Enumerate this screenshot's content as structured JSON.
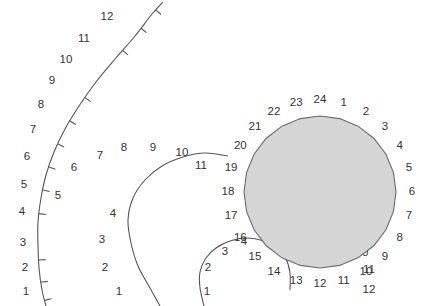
{
  "figure": {
    "title": "",
    "background_color": "#ffffff",
    "curve_color": "#555555",
    "label_color": "#333333",
    "polygon_fill_color": "#d5d5d5",
    "polygon_stroke_color": "#6a6a6a"
  },
  "chart_data": {
    "type": "scatter",
    "title": "",
    "xlabel": "",
    "ylabel": "",
    "grid": false,
    "legend": "none",
    "xlim": [
      0,
      429
    ],
    "ylim": [
      0,
      306
    ],
    "series": [
      {
        "name": "outer-arc",
        "type": "arc-with-ticks",
        "labels": [
          "1",
          "2",
          "3",
          "4",
          "5",
          "6",
          "7",
          "8",
          "9",
          "10",
          "11",
          "12"
        ],
        "label_points": [
          [
            26,
            292
          ],
          [
            25,
            268
          ],
          [
            23,
            243
          ],
          [
            22,
            212
          ],
          [
            24,
            185
          ],
          [
            27,
            157
          ],
          [
            33,
            130
          ],
          [
            41,
            105
          ],
          [
            52,
            81
          ],
          [
            66,
            60
          ],
          [
            84,
            39
          ],
          [
            107,
            17
          ]
        ],
        "path_points": [
          [
            46,
            306
          ],
          [
            42,
            290
          ],
          [
            39,
            268
          ],
          [
            38,
            245
          ],
          [
            38,
            222
          ],
          [
            41,
            198
          ],
          [
            46,
            175
          ],
          [
            54,
            152
          ],
          [
            65,
            129
          ],
          [
            79,
            106
          ],
          [
            96,
            82
          ],
          [
            116,
            58
          ],
          [
            135,
            36
          ],
          [
            152,
            14
          ],
          [
            163,
            2
          ]
        ],
        "has_ticks": true,
        "tick_count": 12
      },
      {
        "name": "middle-arc",
        "type": "arc",
        "labels": [
          "1",
          "2",
          "3",
          "4",
          "5",
          "6",
          "7",
          "8",
          "9",
          "10",
          "11",
          "12"
        ],
        "label_points": [
          [
            119,
            292
          ],
          [
            105,
            268
          ],
          [
            102,
            240
          ],
          [
            113,
            214
          ],
          [
            144,
            196
          ],
          [
            186,
            178
          ],
          [
            74,
            168
          ],
          [
            100,
            156
          ],
          [
            124,
            148
          ],
          [
            153,
            148
          ],
          [
            182,
            153
          ],
          [
            201,
            166
          ]
        ],
        "label_points_actual": [
          [
            119,
            292
          ],
          [
            105,
            268
          ],
          [
            102,
            240
          ],
          [
            113,
            214
          ],
          [
            58,
            196
          ],
          [
            74,
            168
          ],
          [
            100,
            156
          ],
          [
            124,
            148
          ],
          [
            153,
            148
          ],
          [
            182,
            153
          ],
          [
            201,
            166
          ]
        ],
        "path_points": [
          [
            160,
            306
          ],
          [
            150,
            288
          ],
          [
            138,
            266
          ],
          [
            131,
            243
          ],
          [
            128,
            220
          ],
          [
            133,
            198
          ],
          [
            145,
            180
          ],
          [
            162,
            166
          ],
          [
            183,
            157
          ],
          [
            205,
            153
          ],
          [
            228,
            156
          ]
        ]
      },
      {
        "name": "inner-arc",
        "type": "arc",
        "labels": [
          "1",
          "2",
          "3",
          "4",
          "5",
          "6",
          "7",
          "8",
          "9",
          "10",
          "11",
          "12"
        ],
        "label_points": [
          [
            207,
            292
          ],
          [
            208,
            268
          ],
          [
            225,
            252
          ],
          [
            244,
            242
          ],
          [
            265,
            236
          ],
          [
            287,
            234
          ],
          [
            308,
            234
          ],
          [
            327,
            236
          ],
          [
            347,
            242
          ],
          [
            362,
            253
          ],
          [
            369,
            270
          ],
          [
            369,
            290
          ]
        ],
        "path_points": [
          [
            204,
            306
          ],
          [
            200,
            288
          ],
          [
            200,
            272
          ],
          [
            206,
            258
          ],
          [
            216,
            248
          ],
          [
            230,
            241
          ],
          [
            247,
            238
          ],
          [
            264,
            241
          ],
          [
            277,
            248
          ],
          [
            286,
            259
          ],
          [
            290,
            273
          ],
          [
            290,
            290
          ]
        ]
      },
      {
        "name": "filled-polygon-24",
        "type": "polygon",
        "center": [
          320,
          192
        ],
        "radius": 76,
        "sides": 24,
        "start_angle_deg": -75,
        "labels": [
          "1",
          "2",
          "3",
          "4",
          "5",
          "6",
          "7",
          "8",
          "9",
          "10",
          "11",
          "12",
          "13",
          "14",
          "15",
          "16",
          "17",
          "18",
          "19",
          "20",
          "21",
          "22",
          "23",
          "24"
        ],
        "label_radius": 92,
        "fill": "#d5d5d5",
        "stroke": "#6a6a6a"
      }
    ]
  }
}
